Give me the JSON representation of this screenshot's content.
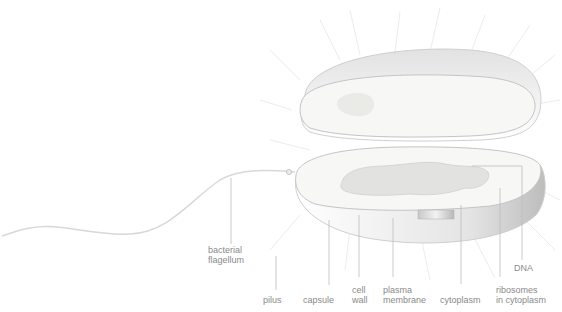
{
  "diagram": {
    "colors": {
      "line": "#bdbdbd",
      "label": "#8a8a8a",
      "shell_shadow": "#c8c8c8",
      "interior": "#f7f7f5",
      "dna": "#d4d4d2"
    },
    "labels": [
      {
        "id": "bacterial-flagellum",
        "text": "bacterial\nflagellum"
      },
      {
        "id": "pilus",
        "text": "pilus"
      },
      {
        "id": "capsule",
        "text": "capsule"
      },
      {
        "id": "cell-wall",
        "text": "cell\nwall"
      },
      {
        "id": "plasma-membrane",
        "text": "plasma\nmembrane"
      },
      {
        "id": "cytoplasm",
        "text": "cytoplasm"
      },
      {
        "id": "ribosomes",
        "text": "ribosomes\nin cytoplasm"
      },
      {
        "id": "dna",
        "text": "DNA"
      }
    ]
  }
}
